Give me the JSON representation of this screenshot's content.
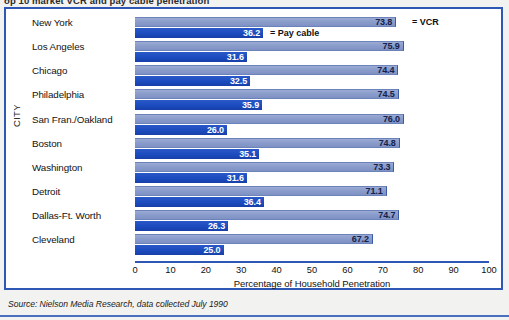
{
  "title_strip": {
    "text": "op 10 market VCR and pay cable penetration"
  },
  "axis": {
    "y_label": "CITY",
    "x_label": "Percentage of Household Penetration",
    "x_ticks": [
      "0",
      "10",
      "20",
      "30",
      "40",
      "50",
      "60",
      "70",
      "80",
      "90",
      "100"
    ]
  },
  "legend": {
    "vcr": "= VCR",
    "cable": "= Pay cable"
  },
  "source": {
    "text": "Source: Nielson Media Research, data collected July 1990"
  },
  "colors": {
    "vcr_bar": "#8b9dcb",
    "cable_bar": "#1c4cc0",
    "frame": "#2f57b5",
    "vcr_value_text": "#14214a",
    "cable_value_text": "#ffffff"
  },
  "chart_data": {
    "type": "bar",
    "orientation": "horizontal",
    "title": "op 10 market VCR and pay cable penetration",
    "xlabel": "Percentage of Household Penetration",
    "ylabel": "CITY",
    "xlim": [
      0,
      100
    ],
    "xticks": [
      0,
      10,
      20,
      30,
      40,
      50,
      60,
      70,
      80,
      90,
      100
    ],
    "grid": false,
    "legend_position": "inline-first-rows",
    "categories": [
      "New York",
      "Los Angeles",
      "Chicago",
      "Philadelphia",
      "San Fran./Oakland",
      "Boston",
      "Washington",
      "Detroit",
      "Dallas-Ft. Worth",
      "Cleveland"
    ],
    "series": [
      {
        "name": "VCR",
        "values": [
          73.8,
          75.9,
          74.4,
          74.5,
          76.0,
          74.8,
          73.3,
          71.1,
          74.7,
          67.2
        ],
        "labels": [
          "73.8",
          "75.9",
          "74.4",
          "74.5",
          "76.0",
          "74.8",
          "73.3",
          "71.1",
          "74.7",
          "67.2"
        ]
      },
      {
        "name": "Pay cable",
        "values": [
          36.2,
          31.6,
          32.5,
          35.9,
          26.0,
          35.1,
          31.6,
          36.4,
          26.3,
          25.0
        ],
        "labels": [
          "36.2",
          "31.6",
          "32.5",
          "35.9",
          "26.0",
          "35.1",
          "31.6",
          "36.4",
          "26.3",
          "25.0"
        ]
      }
    ],
    "source": "Source: Nielson Media Research, data collected July 1990"
  }
}
